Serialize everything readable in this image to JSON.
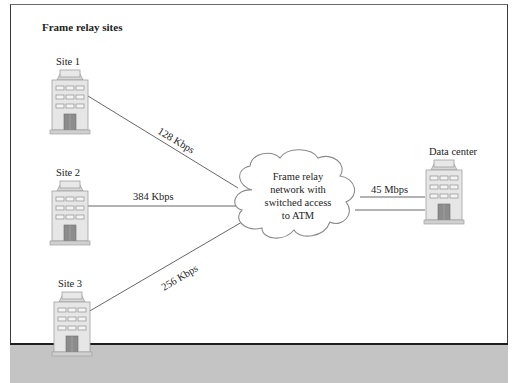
{
  "diagram": {
    "title": "Frame relay sites",
    "sites": [
      {
        "id": "site-1",
        "label": "Site 1",
        "link_speed": "128 Kbps"
      },
      {
        "id": "site-2",
        "label": "Site 2",
        "link_speed": "384 Kbps"
      },
      {
        "id": "site-3",
        "label": "Site 3",
        "link_speed": "256 Kbps"
      }
    ],
    "network": {
      "lines": [
        "Frame relay",
        "network with",
        "switched access",
        "to ATM"
      ]
    },
    "data_center": {
      "label": "Data center",
      "link_speed": "45 Mbps"
    },
    "colors": {
      "building_fill": "#e6e6e6",
      "building_stroke": "#9a9a9a",
      "window_fill": "#f2f2f2",
      "door_fill": "#8a8a8a",
      "cloud_fill": "#ffffff",
      "cloud_stroke": "#888888",
      "link_stroke": "#555555",
      "footer_bar": "#c4c4c4"
    }
  }
}
